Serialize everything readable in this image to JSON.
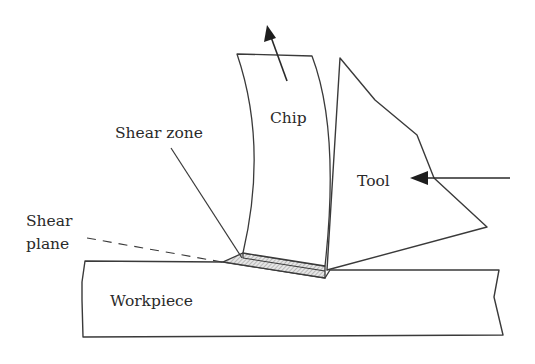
{
  "diagram": {
    "type": "orthogonal cutting / chip formation schematic",
    "labels": {
      "chip": "Chip",
      "tool": "Tool",
      "shear_zone": "Shear zone",
      "shear_plane_line1": "Shear",
      "shear_plane_line2": "plane",
      "workpiece": "Workpiece"
    },
    "arrows": [
      {
        "name": "chip-flow-direction",
        "meaning": "chip moves up along tool face"
      },
      {
        "name": "tool-feed-direction",
        "meaning": "tool pushed leftwards into workpiece"
      }
    ],
    "colors": {
      "stroke": "#3a3a3a",
      "hatch": "#8a8a8a",
      "background": "#ffffff"
    }
  }
}
